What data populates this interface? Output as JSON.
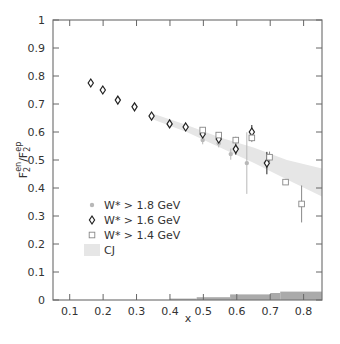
{
  "chart_data": {
    "type": "scatter",
    "title": "",
    "xlabel": "x",
    "ylabel": "F2en/F2ep",
    "ylabel_parts": {
      "base": "F",
      "sub1": "2",
      "sup1": "en",
      "slash": "/",
      "sub2": "2",
      "sup2": "ep"
    },
    "xlim": [
      0.05,
      0.855
    ],
    "ylim": [
      0,
      1
    ],
    "xticks": [
      0.1,
      0.2,
      0.3,
      0.4,
      0.5,
      0.6,
      0.7,
      0.8
    ],
    "xtick_labels": [
      "0.1",
      "0.2",
      "0.3",
      "0.4",
      "0.5",
      "0.6",
      "0.7",
      "0.8"
    ],
    "yticks": [
      0,
      0.1,
      0.2,
      0.3,
      0.4,
      0.5,
      0.6,
      0.7,
      0.8,
      0.9,
      1
    ],
    "ytick_labels": [
      "0",
      "0.1",
      "0.2",
      "0.3",
      "0.4",
      "0.5",
      "0.6",
      "0.7",
      "0.8",
      "0.9",
      "1"
    ],
    "grid": false,
    "legend_position": "lower-left inside",
    "series": [
      {
        "name": "W* > 1.8 GeV",
        "marker": "star",
        "color": "#b8b8b8",
        "points": [
          {
            "x": 0.163,
            "y": 0.775,
            "err": 0.01
          },
          {
            "x": 0.199,
            "y": 0.75,
            "err": 0.01
          },
          {
            "x": 0.244,
            "y": 0.714,
            "err": 0.01
          },
          {
            "x": 0.294,
            "y": 0.69,
            "err": 0.01
          },
          {
            "x": 0.345,
            "y": 0.657,
            "err": 0.01
          },
          {
            "x": 0.399,
            "y": 0.629,
            "err": 0.01
          },
          {
            "x": 0.447,
            "y": 0.618,
            "err": 0.01
          },
          {
            "x": 0.498,
            "y": 0.571,
            "err": 0.015
          },
          {
            "x": 0.546,
            "y": 0.56,
            "err": 0.015
          },
          {
            "x": 0.582,
            "y": 0.521,
            "err": 0.02
          },
          {
            "x": 0.63,
            "y": 0.489,
            "err": 0.11
          }
        ]
      },
      {
        "name": "W* > 1.6 GeV",
        "marker": "diamond",
        "color": "#222222",
        "points": [
          {
            "x": 0.163,
            "y": 0.775,
            "err": 0.01
          },
          {
            "x": 0.199,
            "y": 0.75,
            "err": 0.01
          },
          {
            "x": 0.244,
            "y": 0.714,
            "err": 0.01
          },
          {
            "x": 0.294,
            "y": 0.69,
            "err": 0.01
          },
          {
            "x": 0.345,
            "y": 0.657,
            "err": 0.01
          },
          {
            "x": 0.399,
            "y": 0.629,
            "err": 0.01
          },
          {
            "x": 0.447,
            "y": 0.618,
            "err": 0.012
          },
          {
            "x": 0.498,
            "y": 0.593,
            "err": 0.015
          },
          {
            "x": 0.546,
            "y": 0.575,
            "err": 0.015
          },
          {
            "x": 0.597,
            "y": 0.539,
            "err": 0.02
          },
          {
            "x": 0.645,
            "y": 0.6,
            "err": 0.025
          },
          {
            "x": 0.69,
            "y": 0.489,
            "err": 0.04
          }
        ]
      },
      {
        "name": "W* > 1.4 GeV",
        "marker": "square",
        "color": "#888888",
        "points": [
          {
            "x": 0.498,
            "y": 0.607,
            "err": 0.01
          },
          {
            "x": 0.546,
            "y": 0.589,
            "err": 0.01
          },
          {
            "x": 0.597,
            "y": 0.571,
            "err": 0.012
          },
          {
            "x": 0.645,
            "y": 0.579,
            "err": 0.015
          },
          {
            "x": 0.698,
            "y": 0.51,
            "err": 0.02
          },
          {
            "x": 0.746,
            "y": 0.421,
            "err": 0.01
          },
          {
            "x": 0.794,
            "y": 0.343,
            "err": 0.066
          }
        ]
      }
    ],
    "bands": [
      {
        "name": "CJ",
        "color": "#e6e6e6",
        "upper": [
          [
            0.35,
            0.665
          ],
          [
            0.45,
            0.625
          ],
          [
            0.55,
            0.58
          ],
          [
            0.65,
            0.545
          ],
          [
            0.75,
            0.5
          ],
          [
            0.855,
            0.47
          ]
        ],
        "lower": [
          [
            0.35,
            0.645
          ],
          [
            0.45,
            0.6
          ],
          [
            0.55,
            0.545
          ],
          [
            0.65,
            0.49
          ],
          [
            0.75,
            0.43
          ],
          [
            0.855,
            0.37
          ]
        ]
      }
    ],
    "systematic_histogram": {
      "color": "#aaaaaa",
      "bins": [
        {
          "x0": 0.4,
          "x1": 0.48,
          "h": 0.005
        },
        {
          "x0": 0.48,
          "x1": 0.58,
          "h": 0.01
        },
        {
          "x0": 0.58,
          "x1": 0.7,
          "h": 0.02
        },
        {
          "x0": 0.7,
          "x1": 0.73,
          "h": 0.025
        },
        {
          "x0": 0.73,
          "x1": 0.855,
          "h": 0.03
        }
      ]
    }
  },
  "legend": {
    "items": [
      {
        "label": "W* > 1.8 GeV",
        "marker": "star"
      },
      {
        "label": "W* > 1.6 GeV",
        "marker": "diamond"
      },
      {
        "label": "W* > 1.4 GeV",
        "marker": "square"
      },
      {
        "label": "CJ",
        "marker": "band"
      }
    ]
  }
}
